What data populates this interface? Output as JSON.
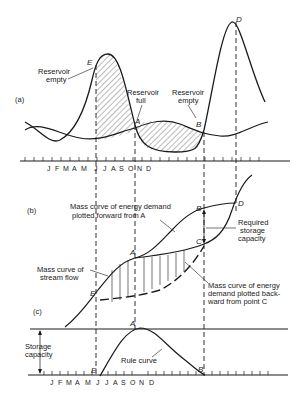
{
  "panels": {
    "a": {
      "label": "(a)",
      "annotations": {
        "reservoir_empty_left": [
          "Reservoir",
          "empty"
        ],
        "reservoir_full": [
          "Reservoir",
          "full"
        ],
        "reservoir_empty_right": [
          "Reservoir",
          "empty"
        ]
      },
      "points": {
        "E": "E",
        "A": "A",
        "B": "B",
        "D": "D"
      },
      "months": [
        "J",
        "F",
        "M",
        "A",
        "M",
        "J",
        "J",
        "A",
        "S",
        "O",
        "N",
        "D"
      ]
    },
    "b": {
      "label": "(b)",
      "annotations": {
        "forward_demand": [
          "Mass curve of energy demand",
          "plotted forward from A"
        ],
        "required_storage": [
          "Required",
          "storage",
          "capacity"
        ],
        "stream_flow": [
          "Mass curve of",
          "stream flow"
        ],
        "backward_demand": [
          "Mass curve of energy",
          "demand plotted back-",
          "ward from point C"
        ]
      },
      "points": {
        "B": "B",
        "D": "D",
        "C": "C",
        "A": "A",
        "E": "E"
      }
    },
    "c": {
      "label": "(c)",
      "annotations": {
        "storage_capacity": [
          "Storage",
          "capacity"
        ],
        "rule_curve": "Rule curve"
      },
      "points": {
        "A": "A",
        "E": "E",
        "B": "B"
      },
      "months": [
        "J",
        "F",
        "M",
        "A",
        "M",
        "J",
        "J",
        "A",
        "S",
        "O",
        "N",
        "D"
      ]
    }
  },
  "colors": {
    "ink": "#1a1a1a",
    "background": "#ffffff"
  }
}
